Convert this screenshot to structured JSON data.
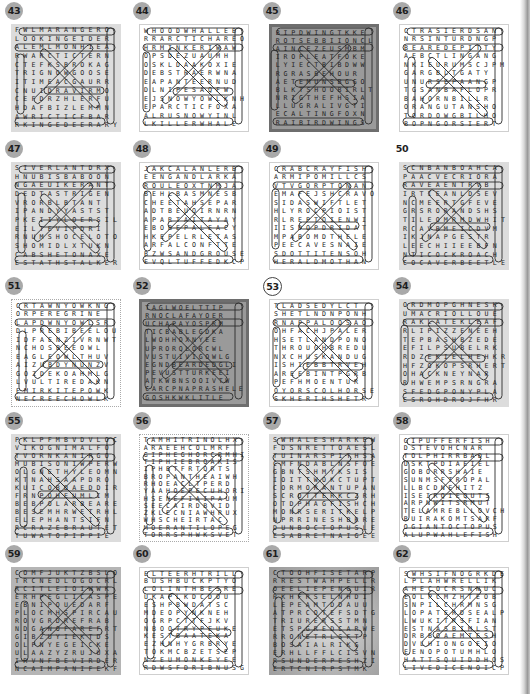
{
  "page": {
    "puzzles": [
      {
        "number": "43",
        "style": "bg-light",
        "badge": "filled",
        "rows": [
          "FWLMARANGERO",
          "LOOKINGEIDER",
          "ALEMLMONHIEA",
          "RWARCTICTERN",
          "CTEFKSBROKAG",
          "TRIGNOWGOOSE",
          "ITIMEACGAURR",
          "CNUIDRAVIRMO",
          "CEFDRZHLERFU",
          "HDAFBIZLEMMN",
          "AWRICTICFBAR",
          "RKINGEDEERARY"
        ]
      },
      {
        "number": "44",
        "style": "bg-white",
        "badge": "filled",
        "rows": [
          "WHOODWHALLEB",
          "RRARCTICHAREO",
          "HRMINKERIWAW",
          "OPSDEZUAUMH",
          "OSKLDAAKOXIE",
          "DEBSTRAERWNA",
          "EAPANTEERNUD",
          "DLNIPESAQFW",
          "EJSNOWYOWLKNH",
          "EPARCTICFOXA",
          "ALRUSNOWYINL",
          "LKILLERWHALE"
        ]
      },
      {
        "number": "45",
        "style": "bg-dark",
        "badge": "filled",
        "rows": [
          "BIPDWINGTKKE",
          "ROTSEBBIIONCL",
          "AINLEZEUSMBM",
          "IROPLEATFOKE",
          "LYIECTBIBDWW",
          "RGRASBEHOUR",
          "AETEMUNSBGGO",
          "BLKTSHOOBIRLT",
          "NRIGTHEFHSIA",
          "LLUGRALIVGTI",
          "ECALTINGFOXN",
          "RAIBIRDWINGS"
        ]
      },
      {
        "number": "46",
        "style": "bg-white",
        "badge": "filled",
        "rows": [
          "CTRASIERDSAN",
          "NRSINTURDNGP",
          "BEAREDEPITTY",
          "AEBCTLINGANG",
          "NKIEURUMSCJPM",
          "GARGBLTGATY",
          "UNURSEPAANGP",
          "TGSANBAFLOPR",
          "BAHORNBILLR",
          "ORANGUTANSHO",
          "TORDOWGBILHO",
          "BOPNGORSIERT"
        ]
      },
      {
        "number": "47",
        "style": "bg-light",
        "badge": "filled",
        "rows": [
          "SIVERLANTDRX",
          "HNUBISBABOON",
          "NGAEUIKERANT",
          "DEDTASTRIGEN",
          "VRORBLBTANT",
          "IPANDYYASTST",
          "PKEIIYLOERSIL",
          "EILTEVIPDRI",
          "RNUMSHOCELOTO",
          "SHOMIDLXTUKN",
          "CABSHETONAXE",
          "ESTATHSTALKER"
        ]
      },
      {
        "number": "48",
        "style": "bg-white",
        "badge": "filled",
        "rows": [
          "JAKCALANLERB",
          "EENGANDLARKA",
          "ROULEOXTNMJA",
          "BEHLBASMNESB",
          "CHEETAHSEPAR",
          "ADTBEUOIRNRN",
          "APARTAITAYAY",
          "EBOBEPALEACY",
          "HKEPELRLETAS",
          "ARFALCONFTTE",
          "BZWSANDGROUSE",
          "EVQLTUFFEDKCP"
        ]
      },
      {
        "number": "49",
        "style": "bg-white",
        "badge": "filled",
        "rows": [
          "CRABCRAYFISH",
          "ARMIPOMILLCS",
          "VTVGORPTONAN",
          "EMAFEJSHCRAVO",
          "SIDASWIFTLET",
          "HLYROCPIOIST",
          "RLREPTOIENWI",
          "IISDOPDRIDAT",
          "MPABOMDTHELE",
          "PEECAVESNAIE",
          "SDOTTITENSOH",
          "HERALDMOTHAN"
        ]
      },
      {
        "number": "50",
        "style": "bg-light",
        "badge": "none",
        "rows": [
          "SCNBANBOAHCA",
          "PAACVECRIORA",
          "RAVEAENTRVB",
          "IRTIEANLDSEV",
          "NCMEERTGFEVE",
          "GRSRORANDSHS",
          "TILEOMRMDWHIT",
          "RCAVBMEICDVM",
          "IKJNAPGESTR",
          "LEECHIIEEBFN",
          "NTICOCKROACH",
          "COCAVERBEETLE"
        ]
      },
      {
        "number": "51",
        "style": "bg-dotted",
        "badge": "filled",
        "rows": [
          "CRTAWNYOWKNG",
          "ORPEREGRINE",
          "LAPDWNYOWLSR",
          "DLPREBIBEELOU",
          "IDFAENZIVRNWT",
          "NCHOSBEEOWL",
          "EAGLEOWLTHUV",
          "AIZUBDYNUNZV",
          "GOZDEKOAHMLG",
          "LVULTIREDAKN",
          "EMIRKITEPOWK",
          "NECREECHOWLK"
        ]
      },
      {
        "number": "52",
        "style": "bg-dark",
        "badge": "filled",
        "rows": [
          "TAGLWOELTTIP",
          "RNOCLAFAYOER",
          "UCHAPAYOSPRM",
          "TICBABLEGDKA",
          "LWOHHOXNYEE",
          "UPRORQLORCWL",
          "VUSTUIVIGOWLG",
          "EGNDBEARDEDGLI",
          "PEVUSTTURKEEI",
          "ATKWBNSOOIVTW",
          "CARCPNAPRASHELE",
          "GOSHKWKLITLE"
        ]
      },
      {
        "number": "53",
        "style": "bg-white",
        "badge": "outline",
        "rows": [
          "TLADSEDYLCT",
          "SHETLNDNPONH",
          "RNAPPALOOSAO",
          "OHFACHJPALER",
          "HSETLANDPONO",
          "THROUGHBREDU",
          "NXCHUSKANDUG",
          "ISHIEBBTRVEH",
          "AREEBINTPGRB",
          "PEFHMOENTUR",
          "OYORSCOLHORSE",
          "SKHERIHSHETR"
        ]
      },
      {
        "number": "54",
        "style": "bg-light",
        "badge": "filled",
        "rows": [
          "ORDMOPGHNESK",
          "UMACRIOLLOUE",
          "RAKLATEKLEAF",
          "RLIPIZZENEEH",
          "TEPBASHBZEDE",
          "EFILPSUBELRK",
          "RDZEKIELHEHKR",
          "HFZOKOPSRHERT",
          "OHACKNEYNAR",
          "RHWEMPSRNGRA",
          "SFEDGPONYPLA",
          "ESROHDROJFHR"
        ]
      },
      {
        "number": "55",
        "style": "bg-light",
        "badge": "filled",
        "rows": [
          "PKLPFMBVDVLOC",
          "VIKOGNIMALFO",
          "TVORNKANIRGO",
          "MUBISONIWPERW",
          "OLGNETHYLEOMN",
          "KTNAHSAAPDRO",
          "KUICOBDAEDDIR",
          "FRNPOHEUMLIM",
          "BEBPOLARBEARE",
          "BESEMHRWETRHL",
          "ELEPHANTSIFN",
          "RCRAZEBRAUTET",
          "TUWATOPIPPIE"
        ]
      },
      {
        "number": "56",
        "style": "bg-dotted",
        "badge": "filled",
        "rows": [
          "TAMHITRINOLHX",
          "ARAEEHCOLMRF",
          "GIPHEGHORCRMHI",
          "TIPHIEBROAKIS",
          "IPHBTFRTQRTS",
          "BROPANTHEAIWH",
          "RHOEACLTPERD",
          "YAAHOEPECUHORI",
          "HSENEFIAIPAUM",
          "SEECAIRDBVID",
          "ZKLECNIAWHRUX",
          "WHSCHEIRTAC",
          "MOERANTILOPEG",
          "TORRSPHWKSVET"
        ]
      },
      {
        "number": "57",
        "style": "bg-light",
        "badge": "filled",
        "rows": [
          "SWHALESHARKEW",
          "FDSNRETTOAESL",
          "TUINARSPITHSA",
          "CMFNDABLNSFOE",
          "GBNTSHMYKSIS",
          "IOITTWOKCTUPT",
          "CORMORANTUPAN",
          "SCROTTERKCZRH",
          "OTDPHAGFISHCH",
          "MONRSERITKELP",
          "NPRRINESHBRRE",
          "DUNBOCTOPUSLE",
          "ESABRETNAIGEE"
        ]
      },
      {
        "number": "58",
        "style": "bg-white",
        "badge": "filled",
        "rows": [
          "GIPUFFERFISH",
          "DSTEVOHCNAR",
          "TOLPHIRRBADL",
          "USKTPDIAEIEL",
          "GOBORRSHAIE",
          "SUNMSFTROPAL",
          "LLBCDNEHITZ",
          "ISEIRQIEQUTS",
          "ARPNWITSRMUT",
          "TELAMREBLLOVCH",
          "BUIRAKOMTSARF",
          "OGIANTOCTOPUS",
          "ALUPWAHLEFISH"
        ]
      },
      {
        "number": "59",
        "style": "bg-mid",
        "badge": "filled",
        "rows": [
          "COMFJUKTZBSLO",
          "TRCNEDLOGOCRL",
          "RCITLEIOIWWK",
          "ERHPEGLICASPE",
          "EBNIPOUEDARF",
          "PLOCMHSPIRCAU",
          "ROVGRDREFRAB",
          "NDGANOFAREFRT",
          "GIBZUYIEKTDS",
          "OLPNYEGEICKE",
          "ULAAZYZRUJUXA",
          "IRVNFBEVIRDER",
          "NCAIMPANIFEKF"
        ]
      },
      {
        "number": "60",
        "style": "bg-white",
        "badge": "filled",
        "rows": [
          "ELTEERHTRILL",
          "BUSHBUCKPTYO",
          "LOLINTHBESRE",
          "UKAPLKDCDOU",
          "ESHPBWDATSC",
          "MDEOPYNKNEH",
          "OGRPCTTFJKV",
          "NBOOTRYPEUKE",
          "KESTBAATEKA",
          "EZHNHYGRBRYE",
          "TOKMCBZETSEP",
          "NZEUMONKEYEE",
          "RDWSFDRIBNUSG"
        ]
      },
      {
        "number": "61",
        "style": "bg-gradient",
        "badge": "filled",
        "rows": [
          "CTOOHFISETARP",
          "RRESTWAHPELLR",
          "OEELIEPENGUIR",
          "RKHFRSELNHDI",
          "LEPEAMTDDAUU",
          "ATPRCOTEFSDTG",
          "TRIURERSSTMN",
          "ETSPGREDCARWE",
          "RRONETRLSFTP",
          "BOSAIALRIKG",
          "ERHLLFFLCISVN",
          "RSUNDERPESHZI",
          "ERTCNIRPSTMK"
        ]
      },
      {
        "number": "62",
        "style": "bg-white",
        "badge": "filled",
        "rows": [
          "SWHSIFNOGRKDE",
          "LPLAHWRELLIK",
          "AHECOCRSNNUC",
          "EOLPCMZHTEOB",
          "SNPILCHRMNSG",
          "LOPATERDSEALP",
          "LWUKITRSFIAN",
          "ESTNASBIMLST",
          "DRBBOAEMTESH",
          "DVLHIONGOEIO",
          "EENOPOTUMHLO",
          "HATTSQUIDDHOS",
          "LIVEDICENOICP"
        ]
      }
    ]
  }
}
